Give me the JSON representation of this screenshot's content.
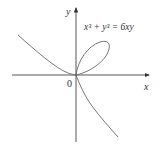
{
  "diagram": {
    "equation": "x³ + y³ = 6xy",
    "axes": {
      "x_label": "x",
      "y_label": "y",
      "origin_label": "0"
    },
    "colors": {
      "curve": "#666666",
      "axes": "#444444",
      "text": "#333333"
    }
  }
}
